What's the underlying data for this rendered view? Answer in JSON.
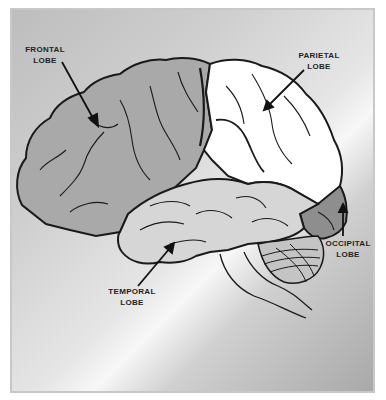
{
  "diagram": {
    "colors": {
      "frontal": "#a9a9a9",
      "parietal": "#ffffff",
      "temporal": "#d6d6d6",
      "occipital": "#8e8e8e",
      "cerebellum": "#c4c4c4",
      "outline": "#1a1a1a"
    },
    "labels": [
      {
        "id": "frontal",
        "line1": "FRONTAL",
        "line2": "LOBE"
      },
      {
        "id": "parietal",
        "line1": "PARIETAL",
        "line2": "LOBE"
      },
      {
        "id": "temporal",
        "line1": "TEMPORAL",
        "line2": "LOBE"
      },
      {
        "id": "occipital",
        "line1": "OCCIPITAL",
        "line2": "LOBE"
      }
    ]
  }
}
